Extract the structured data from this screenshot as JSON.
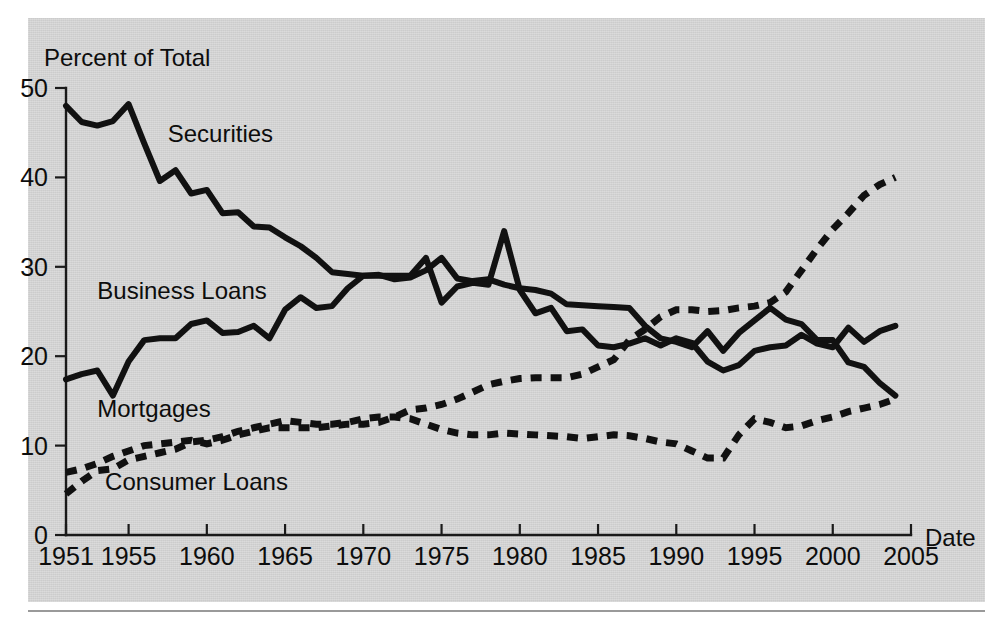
{
  "figure": {
    "panel_background": "#d6d6d6",
    "ink_color": "#111111"
  },
  "chart_data": {
    "type": "line",
    "title": "",
    "subtitle": "",
    "xlabel": "Date",
    "ylabel": "Percent of Total",
    "xlim": [
      1951,
      2005
    ],
    "ylim": [
      0,
      50
    ],
    "grid": false,
    "legend": "inline-annotations",
    "x_ticks": [
      1951,
      1955,
      1960,
      1965,
      1970,
      1975,
      1980,
      1985,
      1990,
      1995,
      2000,
      2005
    ],
    "x_tick_labels": [
      "1951",
      "1955",
      "1960",
      "1965",
      "1970",
      "1975",
      "1980",
      "1985",
      "1990",
      "1995",
      "2000",
      "2005"
    ],
    "y_ticks": [
      0,
      10,
      20,
      30,
      40,
      50
    ],
    "y_tick_labels": [
      "0",
      "10",
      "20",
      "30",
      "40",
      "50"
    ],
    "x": [
      1951,
      1952,
      1953,
      1954,
      1955,
      1956,
      1957,
      1958,
      1959,
      1960,
      1961,
      1962,
      1963,
      1964,
      1965,
      1966,
      1967,
      1968,
      1969,
      1970,
      1971,
      1972,
      1973,
      1974,
      1975,
      1976,
      1977,
      1978,
      1979,
      1980,
      1981,
      1982,
      1983,
      1984,
      1985,
      1986,
      1987,
      1988,
      1989,
      1990,
      1991,
      1992,
      1993,
      1994,
      1995,
      1996,
      1997,
      1998,
      1999,
      2000,
      2001,
      2002,
      2003,
      2004
    ],
    "series": [
      {
        "name": "Securities",
        "style": "solid",
        "label_x": 1957.5,
        "label_y": 44.0,
        "values": [
          48.0,
          46.2,
          45.8,
          46.3,
          48.2,
          43.8,
          39.6,
          40.8,
          38.2,
          38.6,
          36.0,
          36.1,
          34.5,
          34.4,
          33.3,
          32.3,
          31.0,
          29.4,
          29.2,
          29.0,
          29.1,
          28.6,
          28.8,
          29.6,
          31.0,
          28.7,
          28.4,
          28.6,
          28.0,
          27.6,
          27.4,
          27.0,
          25.8,
          25.7,
          25.6,
          25.5,
          25.4,
          23.4,
          22.0,
          21.6,
          21.0,
          22.8,
          20.6,
          22.6,
          24.0,
          25.4,
          24.1,
          23.6,
          21.8,
          21.8,
          19.3,
          18.8,
          17.0,
          15.6
        ]
      },
      {
        "name": "Business Loans",
        "style": "solid",
        "label_x": 1953.0,
        "label_y": 26.4,
        "values": [
          17.4,
          18.0,
          18.4,
          15.6,
          19.4,
          21.8,
          22.0,
          22.0,
          23.6,
          24.0,
          22.6,
          22.7,
          23.4,
          22.0,
          25.2,
          26.6,
          25.4,
          25.6,
          27.6,
          29.0,
          29.0,
          29.0,
          29.0,
          31.0,
          26.0,
          27.8,
          28.2,
          28.0,
          34.0,
          27.4,
          24.8,
          25.4,
          22.8,
          23.0,
          21.2,
          21.0,
          21.4,
          22.0,
          21.2,
          22.0,
          21.5,
          19.4,
          18.4,
          19.0,
          20.6,
          21.0,
          21.2,
          22.4,
          21.4,
          21.0,
          23.2,
          21.6,
          22.8,
          23.4
        ]
      },
      {
        "name": "Mortgages",
        "style": "dashed",
        "label_x": 1953.0,
        "label_y": 13.2,
        "values": [
          7.0,
          7.4,
          8.0,
          8.8,
          9.4,
          10.0,
          10.2,
          10.4,
          10.6,
          10.2,
          10.6,
          11.2,
          11.6,
          12.0,
          12.0,
          12.0,
          12.0,
          12.2,
          12.4,
          12.4,
          12.6,
          13.2,
          14.0,
          14.2,
          14.6,
          15.2,
          16.0,
          16.8,
          17.2,
          17.5,
          17.6,
          17.6,
          17.6,
          18.0,
          18.8,
          19.6,
          21.8,
          23.0,
          24.4,
          25.2,
          25.2,
          25.0,
          25.1,
          25.4,
          25.6,
          26.0,
          27.2,
          29.6,
          32.0,
          34.2,
          36.0,
          38.0,
          39.2,
          40.0
        ]
      },
      {
        "name": "Consumer Loans",
        "style": "dashed",
        "label_x": 1953.5,
        "label_y": 5.0,
        "values": [
          4.6,
          6.0,
          7.2,
          7.4,
          8.4,
          8.8,
          9.2,
          9.6,
          10.4,
          10.6,
          11.0,
          11.6,
          12.0,
          12.4,
          12.8,
          12.6,
          12.4,
          12.4,
          12.6,
          13.0,
          13.2,
          13.2,
          13.0,
          12.4,
          11.8,
          11.4,
          11.2,
          11.2,
          11.4,
          11.3,
          11.2,
          11.1,
          11.0,
          10.8,
          11.0,
          11.2,
          11.1,
          10.8,
          10.4,
          10.2,
          9.4,
          8.6,
          8.6,
          11.2,
          13.0,
          12.6,
          12.0,
          12.2,
          12.8,
          13.2,
          13.8,
          14.2,
          14.6,
          15.2
        ]
      }
    ],
    "annotations": [
      {
        "text": "Securities",
        "series": "Securities"
      },
      {
        "text": "Business Loans",
        "series": "Business Loans"
      },
      {
        "text": "Mortgages",
        "series": "Mortgages"
      },
      {
        "text": "Consumer Loans",
        "series": "Consumer Loans"
      }
    ]
  }
}
